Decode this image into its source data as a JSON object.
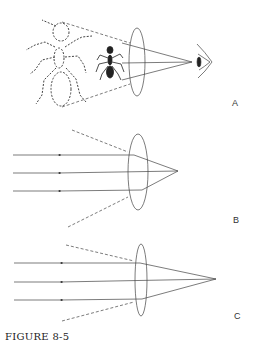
{
  "figure": {
    "caption": "FIGURE 8-5",
    "panels": [
      {
        "id": "A",
        "label": "A",
        "description": "Magnifying lens: small ant viewed through convex lens appears as enlarged virtual image (dashed) to the eye"
      },
      {
        "id": "B",
        "label": "B",
        "description": "Parallel rays converge through thick convex lens to a near focal point"
      },
      {
        "id": "C",
        "label": "C",
        "description": "Parallel rays converge through thinner convex lens to a more distant focal point"
      }
    ]
  },
  "colors": {
    "line": "#333333",
    "background": "#ffffff"
  }
}
